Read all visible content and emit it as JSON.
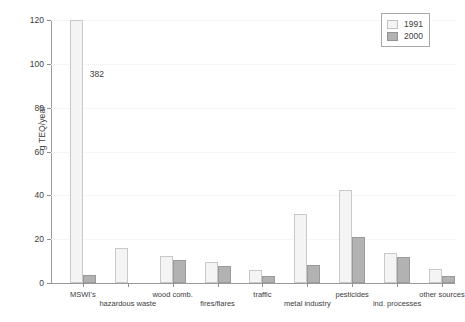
{
  "chart_data": {
    "type": "bar",
    "title": "",
    "xlabel": "",
    "ylabel": "g TEQ/year",
    "ylim": [
      0,
      120
    ],
    "yticks": [
      0,
      20,
      40,
      60,
      80,
      100,
      120
    ],
    "ytick_labels": [
      "0",
      "20",
      "40",
      "60",
      "80",
      "100",
      "120"
    ],
    "grid": true,
    "legend_position": "top-right",
    "categories": [
      "MSWI's",
      "hazardous waste",
      "wood comb.",
      "fires/flares",
      "traffic",
      "metal industry",
      "pesticides",
      "ind. processes",
      "other sources"
    ],
    "series": [
      {
        "name": "1991",
        "color": "#f4f4f4",
        "values": [
          120,
          16.2,
          12.5,
          9.6,
          6.0,
          31.3,
          42.6,
          13.6,
          6.5
        ]
      },
      {
        "name": "2000",
        "color": "#b2b2b2",
        "values": [
          3.6,
          0,
          10.6,
          7.6,
          3.0,
          8.2,
          20.8,
          12.0,
          3.2
        ]
      }
    ],
    "annotations": [
      {
        "text": "382",
        "category": "MSWI's",
        "series": "1991",
        "note": "true value exceeds axis maximum; bar is clipped at 120"
      }
    ]
  },
  "legend": {
    "items": [
      {
        "label": "1991",
        "swatch": "legend-swatch-1991"
      },
      {
        "label": "2000",
        "swatch": "legend-swatch-2000"
      }
    ]
  }
}
